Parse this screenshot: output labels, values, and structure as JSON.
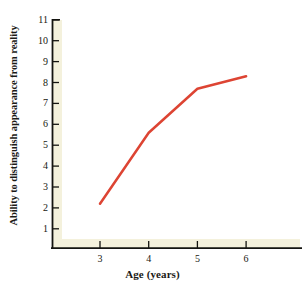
{
  "chart_data": {
    "type": "line",
    "title": "",
    "xlabel": "Age (years)",
    "ylabel": "Ability to distinguish appearance from reality",
    "x": [
      3,
      4,
      5,
      6
    ],
    "values": [
      2.2,
      5.6,
      7.7,
      8.3
    ],
    "series": [
      {
        "name": "Ability to distinguish appearance from reality",
        "color": "#DD4433",
        "x": [
          3,
          4,
          5,
          6
        ],
        "values": [
          2.2,
          5.6,
          7.7,
          8.3
        ]
      }
    ],
    "xlim": [
      2.4,
      6.6
    ],
    "ylim": [
      0,
      11
    ],
    "xticks": [
      3,
      4,
      5,
      6
    ],
    "xtick_labels": [
      "3",
      "4",
      "5",
      "6"
    ],
    "yticks": [
      1,
      2,
      3,
      4,
      5,
      6,
      7,
      8,
      9,
      10,
      11
    ],
    "ytick_labels": [
      "1",
      "2",
      "3",
      "4",
      "5",
      "6",
      "7",
      "8",
      "9",
      "10",
      "11"
    ],
    "grid": false,
    "legend": "none",
    "markers": false,
    "line_width": 2.5
  },
  "style": {
    "line_color": "#DD4433",
    "axis_color": "#141410",
    "band_color": "#F4F1DC",
    "background": "#FFFFFF",
    "text_color": "#17170F"
  }
}
